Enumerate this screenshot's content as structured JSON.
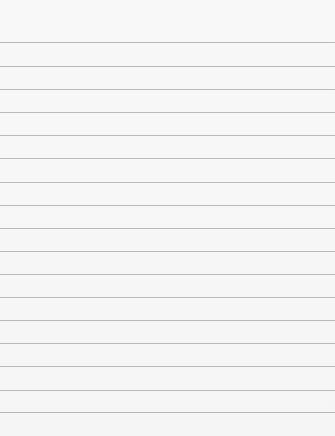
{
  "page": {
    "type": "lined-paper",
    "background_color": "#f7f7f7",
    "rule_color": "#b9b9b9",
    "rule_positions_px": [
      42,
      66,
      89,
      112,
      135,
      158,
      182,
      205,
      228,
      251,
      274,
      297,
      320,
      343,
      366,
      390,
      412
    ]
  }
}
